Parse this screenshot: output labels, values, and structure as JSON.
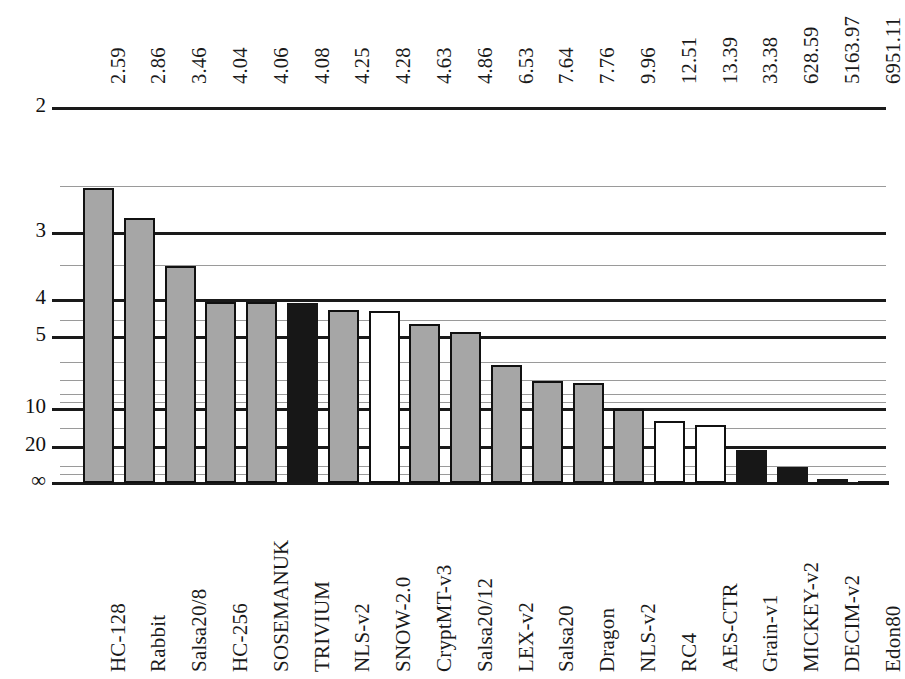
{
  "chart_data": {
    "type": "bar",
    "title": "",
    "subtitle": "",
    "xlabel": "",
    "ylabel": "",
    "orientation": "vertical",
    "scale": "inverted-log",
    "axis_note": "Y axis is inverted: smaller values plot higher; bars grow downward from small values toward infinity",
    "ylim": [
      2,
      "infinity"
    ],
    "ytick_labels": [
      "2",
      "3",
      "4",
      "5",
      "10",
      "20",
      "∞"
    ],
    "ytick_values": [
      2,
      3,
      4,
      5,
      10,
      20,
      100000
    ],
    "grid": true,
    "grid_minor": true,
    "legend": [],
    "categories": [
      "HC-128",
      "Rabbit",
      "Salsa20/8",
      "HC-256",
      "SOSEMANUK",
      "TRIVIUM",
      "NLS-v2",
      "SNOW-2.0",
      "CryptMT-v3",
      "Salsa20/12",
      "LEX-v2",
      "Salsa20",
      "Dragon",
      "NLS-v2",
      "RC4",
      "AES-CTR",
      "Grain-v1",
      "MICKEY-v2",
      "DECIM-v2",
      "Edon80"
    ],
    "values": [
      2.59,
      2.86,
      3.46,
      4.04,
      4.06,
      4.08,
      4.25,
      4.28,
      4.63,
      4.86,
      6.53,
      7.64,
      7.76,
      9.96,
      12.51,
      13.39,
      33.38,
      628.59,
      5163.97,
      6951.11
    ],
    "value_labels": [
      "2.59",
      "2.86",
      "3.46",
      "4.04",
      "4.06",
      "4.08",
      "4.25",
      "4.28",
      "4.63",
      "4.86",
      "6.53",
      "7.64",
      "7.76",
      "9.96",
      "12.51",
      "13.39",
      "33.38",
      "628.59",
      "5163.97",
      "6951.11"
    ],
    "bars": [
      {
        "label": "HC-128",
        "value": 2.59,
        "value_label": "2.59",
        "fill": "gray"
      },
      {
        "label": "Rabbit",
        "value": 2.86,
        "value_label": "2.86",
        "fill": "gray"
      },
      {
        "label": "Salsa20/8",
        "value": 3.46,
        "value_label": "3.46",
        "fill": "gray"
      },
      {
        "label": "HC-256",
        "value": 4.04,
        "value_label": "4.04",
        "fill": "gray"
      },
      {
        "label": "SOSEMANUK",
        "value": 4.06,
        "value_label": "4.06",
        "fill": "gray"
      },
      {
        "label": "TRIVIUM",
        "value": 4.08,
        "value_label": "4.08",
        "fill": "black"
      },
      {
        "label": "NLS-v2",
        "value": 4.25,
        "value_label": "4.25",
        "fill": "gray"
      },
      {
        "label": "SNOW-2.0",
        "value": 4.28,
        "value_label": "4.28",
        "fill": "white"
      },
      {
        "label": "CryptMT-v3",
        "value": 4.63,
        "value_label": "4.63",
        "fill": "gray"
      },
      {
        "label": "Salsa20/12",
        "value": 4.86,
        "value_label": "4.86",
        "fill": "gray"
      },
      {
        "label": "LEX-v2",
        "value": 6.53,
        "value_label": "6.53",
        "fill": "gray"
      },
      {
        "label": "Salsa20",
        "value": 7.64,
        "value_label": "7.64",
        "fill": "gray"
      },
      {
        "label": "Dragon",
        "value": 7.76,
        "value_label": "7.76",
        "fill": "gray"
      },
      {
        "label": "NLS-v2",
        "value": 9.96,
        "value_label": "9.96",
        "fill": "gray"
      },
      {
        "label": "RC4",
        "value": 12.51,
        "value_label": "12.51",
        "fill": "white"
      },
      {
        "label": "AES-CTR",
        "value": 13.39,
        "value_label": "13.39",
        "fill": "white"
      },
      {
        "label": "Grain-v1",
        "value": 33.38,
        "value_label": "33.38",
        "fill": "black"
      },
      {
        "label": "MICKEY-v2",
        "value": 628.59,
        "value_label": "628.59",
        "fill": "black"
      },
      {
        "label": "DECIM-v2",
        "value": 5163.97,
        "value_label": "5163.97",
        "fill": "black"
      },
      {
        "label": "Edon80",
        "value": 6951.11,
        "value_label": "6951.11",
        "fill": "black"
      }
    ],
    "colors": {
      "bar_gray": "#a6a6a6",
      "bar_white": "#ffffff",
      "bar_black": "#171717",
      "border": "#111111",
      "gridline_major": "#1a1a1a",
      "gridline_minor": "#9a9a9a",
      "background": "#ffffff",
      "text": "#1a1a1a"
    }
  }
}
